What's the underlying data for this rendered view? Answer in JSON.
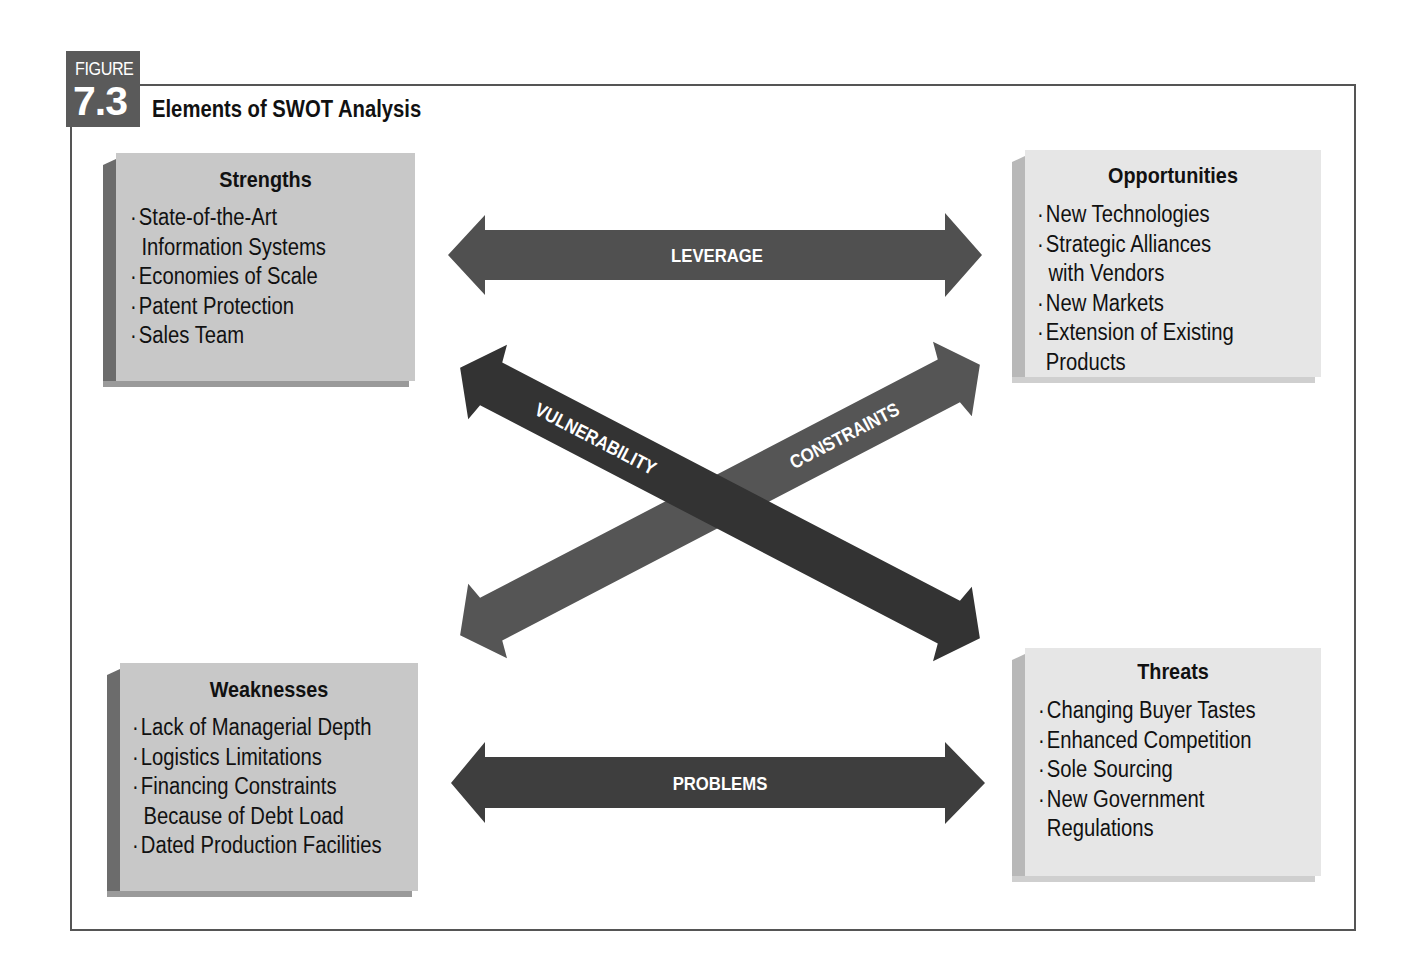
{
  "figure": {
    "label": "FIGURE",
    "number": "7.3",
    "title": "Elements of SWOT Analysis"
  },
  "quadrants": {
    "strengths": {
      "title": "Strengths",
      "items": [
        {
          "bullet": "·",
          "text": "State-of-the-Art"
        },
        {
          "bullet": "",
          "text": "Information Systems"
        },
        {
          "bullet": "·",
          "text": "Economies of Scale"
        },
        {
          "bullet": "·",
          "text": "Patent Protection"
        },
        {
          "bullet": "·",
          "text": "Sales Team"
        }
      ]
    },
    "opportunities": {
      "title": "Opportunities",
      "items": [
        {
          "bullet": "·",
          "text": "New Technologies"
        },
        {
          "bullet": "·",
          "text": "Strategic Alliances"
        },
        {
          "bullet": "",
          "text": "with Vendors"
        },
        {
          "bullet": "·",
          "text": "New Markets"
        },
        {
          "bullet": "·",
          "text": "Extension of Existing"
        },
        {
          "bullet": "",
          "text": "Products"
        }
      ]
    },
    "weaknesses": {
      "title": "Weaknesses",
      "items": [
        {
          "bullet": "·",
          "text": "Lack of Managerial Depth"
        },
        {
          "bullet": "·",
          "text": "Logistics Limitations"
        },
        {
          "bullet": "·",
          "text": "Financing Constraints"
        },
        {
          "bullet": "",
          "text": "Because of Debt Load"
        },
        {
          "bullet": "·",
          "text": "Dated Production Facilities"
        }
      ]
    },
    "threats": {
      "title": "Threats",
      "items": [
        {
          "bullet": "·",
          "text": "Changing Buyer Tastes"
        },
        {
          "bullet": "·",
          "text": "Enhanced Competition"
        },
        {
          "bullet": "·",
          "text": "Sole Sourcing"
        },
        {
          "bullet": "·",
          "text": "New Government"
        },
        {
          "bullet": "",
          "text": "Regulations"
        }
      ]
    }
  },
  "arrows": {
    "leverage": {
      "label": "LEVERAGE",
      "from": "Strengths",
      "to": "Opportunities"
    },
    "problems": {
      "label": "PROBLEMS",
      "from": "Weaknesses",
      "to": "Threats"
    },
    "vulnerability": {
      "label": "VULNERABILITY",
      "from": "Strengths",
      "to": "Threats"
    },
    "constraints": {
      "label": "CONSTRAINTS",
      "from": "Weaknesses",
      "to": "Opportunities"
    }
  },
  "colors": {
    "frame": "#555555",
    "badge": "#5a5a5a",
    "arrow_dark": "#3a3a3a",
    "arrow_mid": "#555555",
    "box_dark": "#c8c8c8",
    "box_light": "#e6e6e6"
  }
}
